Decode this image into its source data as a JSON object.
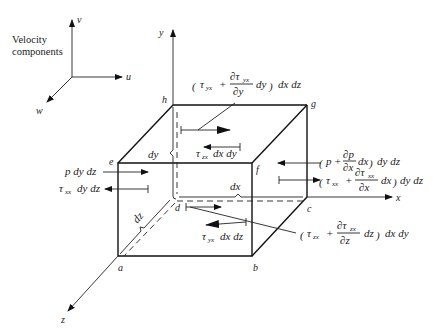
{
  "legend": {
    "title_line1": "Velocity",
    "title_line2": "components",
    "axis_v": "v",
    "axis_u": "u",
    "axis_w": "w"
  },
  "axes": {
    "x": "x",
    "y": "y",
    "z": "z"
  },
  "corners": {
    "a": "a",
    "b": "b",
    "c": "c",
    "d": "d",
    "e": "e",
    "f": "f",
    "g": "g",
    "h": "h"
  },
  "dimensions": {
    "dx": "dx",
    "dy": "dy",
    "dz": "dz"
  },
  "forces": {
    "top_shear": {
      "tau": "τ",
      "tau_sub": "yx",
      "plus": "+",
      "num": "∂τ",
      "num_sub": "yx",
      "den": "∂y",
      "diff": "dy",
      "area": "dx dz"
    },
    "back_shear": {
      "tau": "τ",
      "tau_sub": "zx",
      "area": "dx dy"
    },
    "left_pressure": {
      "text": "p dy dz"
    },
    "left_normal": {
      "tau": "τ",
      "tau_sub": "xx",
      "area": "dy dz"
    },
    "right_pressure": {
      "p": "p",
      "plus": "+",
      "num": "∂p",
      "den": "∂x",
      "diff": "dx",
      "area": "dy dz"
    },
    "right_normal": {
      "tau": "τ",
      "tau_sub": "xx",
      "plus": "+",
      "num": "∂τ",
      "num_sub": "xx",
      "den": "∂x",
      "diff": "dx",
      "area": "dy dz"
    },
    "bottom_shear": {
      "tau": "τ",
      "tau_sub": "yx",
      "area": "dx dz"
    },
    "front_shear": {
      "tau": "τ",
      "tau_sub": "zx",
      "plus": "+",
      "num": "∂τ",
      "num_sub": "zx",
      "den": "∂z",
      "diff": "dz",
      "area": "dx dy"
    }
  }
}
